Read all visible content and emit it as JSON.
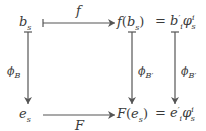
{
  "diagram": {
    "type": "commutative-diagram",
    "nodes": {
      "top_left": {
        "base": "b",
        "sub": "s"
      },
      "top_mid": {
        "func": "f",
        "arg_base": "b",
        "arg_sub": "s"
      },
      "top_right": {
        "eq": "=",
        "base": "b",
        "prime": "′",
        "sub": "i",
        "phi": "φ",
        "phi_sup": "i",
        "phi_sub": "s"
      },
      "bot_left": {
        "base": "e",
        "sub": "s"
      },
      "bot_mid": {
        "func": "F",
        "arg_base": "e",
        "arg_sub": "s"
      },
      "bot_right": {
        "eq": "=",
        "base": "e",
        "prime": "′",
        "sub": "i",
        "phi": "φ",
        "phi_sup": "i",
        "phi_sub": "s"
      }
    },
    "arrows": {
      "top": {
        "label": "f",
        "style": "maps-to"
      },
      "bottom": {
        "label": "F",
        "style": "arrow"
      },
      "left": {
        "label_base": "ϕ",
        "label_sub": "B",
        "style": "maps-to"
      },
      "middle": {
        "label_base": "ϕ",
        "label_sub": "B′",
        "style": "maps-to"
      },
      "right": {
        "label_base": "ϕ",
        "label_sub": "B′",
        "style": "maps-to"
      }
    },
    "line_color": "#555555"
  }
}
